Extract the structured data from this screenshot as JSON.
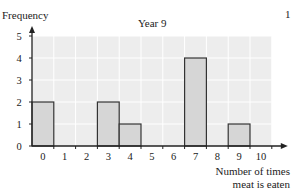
{
  "page_number": "1",
  "chart_data": {
    "type": "bar",
    "title": "Year 9",
    "xlabel": "Number of times meat is eaten",
    "xlabel_lines": [
      "Number of times",
      "meat is eaten"
    ],
    "ylabel": "Frequency",
    "categories": [
      "0",
      "1",
      "2",
      "3",
      "4",
      "5",
      "6",
      "7",
      "8",
      "9",
      "10"
    ],
    "values": [
      2,
      0,
      0,
      2,
      1,
      0,
      0,
      4,
      0,
      1,
      0
    ],
    "ylim": [
      0,
      5
    ],
    "yticks": [
      "0",
      "1",
      "2",
      "3",
      "4",
      "5"
    ],
    "xticks": [
      "0",
      "1",
      "2",
      "3",
      "4",
      "5",
      "6",
      "7",
      "8",
      "9",
      "10"
    ],
    "grid": true,
    "legend": null,
    "colors": {
      "bar_fill": "#d6d6d6",
      "bar_stroke": "#333333",
      "plot_bg": "#ededed",
      "grid": "#ffffff"
    }
  }
}
